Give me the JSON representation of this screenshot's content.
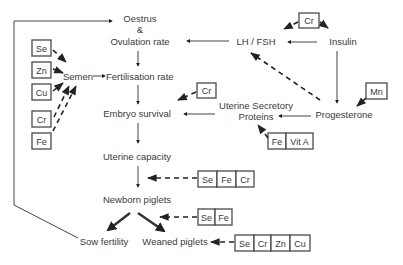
{
  "nodes": {
    "oestrus": "Oestrus",
    "ampersand": "&",
    "ovulation_rate": "Ovulation rate",
    "lh_fsh": "LH / FSH",
    "insulin": "Insulin",
    "semen": "Semen",
    "fertilisation_rate": "Fertilisation rate",
    "embryo_survival": "Embryo survival",
    "uterine_secretory": "Uterine Secretory",
    "proteins": "Proteins",
    "progesterone": "Progesterone",
    "uterine_capacity": "Uterine capacity",
    "newborn_piglets": "Newborn piglets",
    "sow_fertility": "Sow fertility",
    "weaned_piglets": "Weaned piglets"
  },
  "nutrient_boxes": {
    "semen_inputs": [
      "Se",
      "Zn",
      "Cu",
      "Cr",
      "Fe"
    ],
    "insulin_lh_input": [
      "Cr"
    ],
    "embryo_input": [
      "Cr"
    ],
    "progesterone_input": [
      "Mn"
    ],
    "proteins_input": [
      "Fe",
      "Vit A"
    ],
    "uterine_capacity_input": [
      "Se",
      "Fe",
      "Cr"
    ],
    "newborn_input": [
      "Se",
      "Fe"
    ],
    "weaned_input": [
      "Se",
      "Cr",
      "Zn",
      "Cu"
    ]
  },
  "colors": {
    "line": "#444444",
    "text": "#3a3a3a",
    "background": "#ffffff"
  }
}
